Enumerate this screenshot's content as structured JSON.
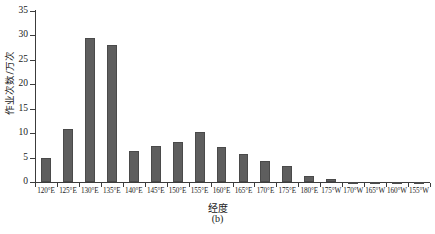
{
  "chart_data": {
    "type": "bar",
    "title": "",
    "subtitle": "",
    "panel_label": "(b)",
    "xlabel": "经度",
    "ylabel": "作业次数/万次",
    "categories": [
      "120°E",
      "125°E",
      "130°E",
      "135°E",
      "140°E",
      "145°E",
      "150°E",
      "155°E",
      "160°E",
      "165°E",
      "170°E",
      "175°E",
      "180°E",
      "175°W",
      "170°W",
      "165°W",
      "160°W",
      "155°W"
    ],
    "values": [
      5.0,
      10.9,
      29.5,
      28.1,
      6.4,
      7.3,
      8.2,
      10.2,
      7.2,
      5.8,
      4.3,
      3.3,
      1.2,
      0.7,
      0.05,
      0.05,
      0.05,
      0.05
    ],
    "ylim": [
      0,
      35
    ],
    "yticks": [
      0,
      5,
      10,
      15,
      20,
      25,
      30,
      35
    ],
    "ytick_labels": [
      "0",
      "5",
      "10",
      "15",
      "20",
      "25",
      "30",
      "35"
    ],
    "grid": false,
    "legend": null,
    "bar_color": "#5e5e5e",
    "axis_color": "#3c3c3c"
  }
}
